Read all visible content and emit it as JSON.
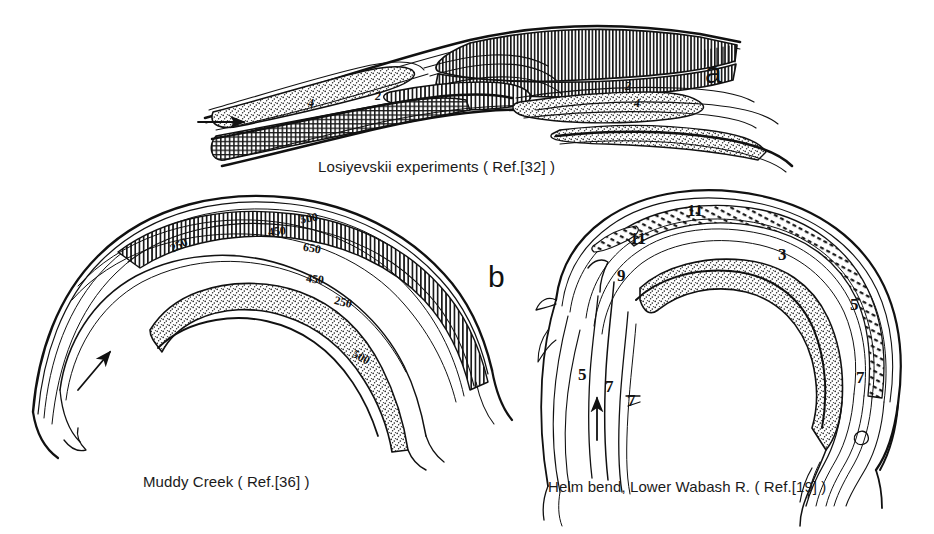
{
  "figure": {
    "background_color": "#ffffff",
    "ink_color": "#111111",
    "type": "line-drawing-figure"
  },
  "panels": [
    {
      "id": "a",
      "letter": "a",
      "letter_pos": {
        "x": 705,
        "y": 58
      },
      "caption": "Losiyevskii experiments ( Ref.[32] )",
      "caption_pos": {
        "x": 318,
        "y": 158
      },
      "flow_arrow": {
        "direction": "right",
        "x": 198,
        "y": 122
      },
      "labels": [
        {
          "text": "4",
          "x": 308,
          "y": 96
        },
        {
          "text": "2",
          "x": 375,
          "y": 89
        },
        {
          "text": "2",
          "x": 625,
          "y": 79
        },
        {
          "text": "4",
          "x": 634,
          "y": 96
        }
      ]
    },
    {
      "id": "b",
      "letter": "b",
      "letter_pos": {
        "x": 488,
        "y": 262
      },
      "caption": "Muddy Creek ( Ref.[36] )",
      "caption_pos": {
        "x": 143,
        "y": 473
      },
      "flow_arrow": {
        "direction": "up-right",
        "x": 85,
        "y": 370
      },
      "contour_labels": [
        {
          "text": "250",
          "x": 170,
          "y": 238,
          "rotate": -28
        },
        {
          "text": "450",
          "x": 268,
          "y": 224,
          "rotate": -6
        },
        {
          "text": "500",
          "x": 300,
          "y": 211,
          "rotate": -10
        },
        {
          "text": "650",
          "x": 303,
          "y": 241,
          "rotate": 10
        },
        {
          "text": "450",
          "x": 306,
          "y": 272,
          "rotate": 6
        },
        {
          "text": "250",
          "x": 334,
          "y": 295,
          "rotate": 14
        },
        {
          "text": "500",
          "x": 352,
          "y": 350,
          "rotate": 28
        }
      ]
    },
    {
      "id": "c",
      "letter": "",
      "caption": "Helm bend, Lower Wabash R. ( Ref.[19] )",
      "caption_pos": {
        "x": 548,
        "y": 478
      },
      "flow_arrow": {
        "direction": "up",
        "x": 597,
        "y": 420
      },
      "labels": [
        {
          "text": "11",
          "x": 687,
          "y": 201
        },
        {
          "text": "11",
          "x": 630,
          "y": 229
        },
        {
          "text": "9",
          "x": 617,
          "y": 266
        },
        {
          "text": "3",
          "x": 778,
          "y": 245
        },
        {
          "text": "5",
          "x": 850,
          "y": 295
        },
        {
          "text": "5",
          "x": 578,
          "y": 365
        },
        {
          "text": "7",
          "x": 605,
          "y": 377
        },
        {
          "text": "7",
          "x": 627,
          "y": 391
        },
        {
          "text": "7",
          "x": 856,
          "y": 368
        }
      ]
    }
  ],
  "legend_semantics": {
    "stipple": "point-bar / sand deposit",
    "vertical_hatch": "deep scour zone along outer bank",
    "thin_contours": "bed elevation or depth contours",
    "arrow": "flow direction"
  }
}
